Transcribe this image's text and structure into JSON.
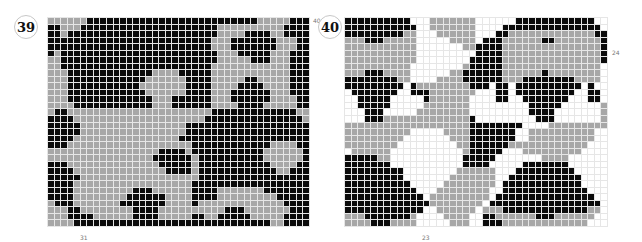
{
  "figures": [
    {
      "number": "39",
      "side_label": "40",
      "bottom_label": "31",
      "colors": {
        "B": "#0b0b0b",
        "G": "#a7a7a7",
        "W": "#ffffff"
      },
      "cols": 40,
      "rows": [
        "GGGGGGBBBBBBBBBBBBBBBBBBBBBBBBBBGGGGGBBB",
        "BBGGGBBBBBBBBBBBBBBBBBBBBBGGGGGGGGGGBBBB",
        "BBGBBBBBBBBBBBBBBBBBBBBBBBGGGGBBBBGGBBBB",
        "BBBBBBBBBBBBBBBBBBBBBBBBBGGGBBBBBBBGGGBB",
        "BBBBBBBBBBBBBBBBBBBBBBBBBGGGBBBBBBBGGGBB",
        "BGBBBBBBBBBBBBBBBBBBBBBBBBGGGBBBBBGGGBBB",
        "GGBBBBBBBBBBBBBBBBBBBBBBBBGGGGGBBBGGGBBB",
        "GGBBBBBBBBBBBBBBBBBBBBBBBGGGGGGGGGGGGBBB",
        "GGGBBBBBBBBBBBBBGGGGBBBBBGGGGGGGGGGGGBBB",
        "GGGBBBBBBBBBBBBGGGGGGBBBBGGGGGBBGGGGGBBB",
        "GGGBBBBBBBBBBBGGGGGGGBBBBGGGGBBBBGGGGBBB",
        "GGGBBBBBBBBBBBBGGGGGGBBBBGGGBBBBBBGGGBBB",
        "GGGBBBBBBBBBBBBBGGGBBBBBBGGGBBBBBBGGGGBB",
        "GGGGBBBBBBBBBBBBGGGBBBBBBGGGGBBBBGGGGGBB",
        "GBBGGGGGGGGGGGGGGGGGGGGGGBBBBBBBBBBBBBGG",
        "BBBBGGGGGGGGGGGGGGGGGGGGBBBBBBBBBBBBBBBG",
        "BBBBBGGGGGGGGGGGGGGGGBBBBBBBBBBBBBBBBBBB",
        "BBBBBGGGGGGGGGGGGGGGGBBBBBBBBBBBBBBBBBBB",
        "BBBBGGGGGGGGGGGGGGGGBBBBBBBBBBBBBBBBBBBB",
        "BBBGGGGGGGGGGGGGGGGGGGBBBBBBBBBBBBGGGGBB",
        "GGGGGGGGGGGGGGGGGBBBBGBBBBBBBBBBBGGGGGGB",
        "GGGGGGGGGGGGGGGGBBBBBBGBBBBBBBBBBGGGGGGB",
        "BBBGGGGGGGGGGGGGGBBBBBGBBBBBBBBBBBGGGGBB",
        "BBBBGGGGGGGGGGGGGGBBBBGBBBBBBBBBBBBGGBBB",
        "BBBBBGGGGGGGGGGGGGGGGGGBBBBBBBBBBBBBBBBB",
        "BBBBGGGGGGGGGGGGGGGGGGBBBBBBBBBBBBBBBBBB",
        "BBBBGGGGGGGGGBBBGGGGGGBBBBGGGGGGGBBBBBBB",
        "BBBBGGGGGGGGBBBBBBGGGGBBBBGGGGGGGGGBBBBB",
        "GBBBGGGGGGGBBBBBBBGGGGBGGGGGGGGGGGGGBBBB",
        "GGGBBGGGGGGGGBBBBGGGGGGGGGGBBBGGGGGGGBBB",
        "GGGBBBBGGGGGGBBBBGGGGGBBGGBBBBBGGGGGBBBB",
        "GGGGBBBBBBBBBBBBBBBBBBBBBBBBBBBBBBGGBBBB"
      ]
    },
    {
      "number": "40",
      "side_label": "24",
      "bottom_label": "23",
      "colors": {
        "B": "#0b0b0b",
        "G": "#a7a7a7",
        "W": "#ffffff"
      },
      "cols": 40,
      "rows": [
        "BBBBBBBBBBWWWGGGGGGGWWWWWWBBBBBBBBBBBBWW",
        "BBBBBBBBBBBWWGGGGGGGWWWWBBBBBBBBBBBBBBBW",
        "BBBBBBBBBGGWWWGGGGGGWWWBBGGGGGGGGGGGGGBB",
        "GGGBBBGGGGGWWWWWGGGGWBBBGGGGGGBBGGGGGGGB",
        "GGGGGGGGGGGWWWWWWWGGBBBBGGGGGGGGGGGGGGGB",
        "GGGGGGGGGGGWWWWWWWWWBBBBGGGGGGGGGGGGGGGB",
        "GGGGGGGGGGGWWWWWWWWBBBBBGGGGGGGGGGGGGGGB",
        "GGGGGGGGGGWWWWWWWWGBBBBBGGGGGGGGGGGGGGGW",
        "GGGBBBGGGGWWWWWWGGBBBBBBGGGGGGBGGGGGGGGW",
        "BBBBBBBBGGWWWWGGGGBBBBBBGGGBBBBBBBBGGGGW",
        "BBBBBBBBBWBGGGGGGGGBBBWBBWBBBBBBBBBBWBWW",
        "WBBBBBBBWWBBBGGGGGGGWWWBBWBBBBBBBBBWWBBW",
        "WWBBBBBWWWWWBGGGGGGWWWWBBWWBBBBBBBWWWBBW",
        "WWBBBBBWWWWWGGGGGGGWWWWWWWWWBBBBBWWWWWWG",
        "WWWBBBWWWWWGGGGGGGGWWWWWWWWWBBBBWWWWWWWG",
        "WWWBBBGGGGGGGGGGGGGBWWWWWWWWWBBBWWWWWWWG",
        "GGGGGGGGGGGGGGGGGGGBBBBBBBBWWWWGGGGGGGGG",
        "GGGGGGGGGGWWWWWGGGGBBBBBBBWWGGGGGGGGGGWW",
        "GGGGGGGGGWWWWWWWGGGBBBBBBBWWGGGGGGGGGGWW",
        "GGGGGGGGWWWWWWWWWGGBBBBBBGGGGGGGGGGGGWWW",
        "WGGGGGGWWWWWWWWWWWGBBBBBWWWGGGGGGGGGWWWW",
        "BBBBBGGWWWWWWWWWWWBBBBBWWWWWWWGGGGWWWWWW",
        "BBBBBBBWWWWWWWWWWWBBBBWWWWWBBBBBBBWWWWWW",
        "BBBBBBBBBWWWWWWWWGGGGGGWWWBBBBBBBBBWWWWW",
        "BBBBBBBBBWWWWWWWGGGGGGGWWBBBBBBBBBBBWWWW",
        "BBBBBBBBBBWWWWWGGGGGGGGWBBBBBBBBBBBBWWWW",
        "BBBBBBBBBBBWWWGGGGGGGGWWBBBBBBBBBBBBBWWW",
        "BBBBBBBBBBBBWGGGGGGGGGWBBBBBBBBBBBBBBBWW",
        "BBBBBBBBBBBBBGGGGGGGGWBBBBBBBBBBBBBBBBBW",
        "BBBBBBBBBBBBWWGGGGGGWGGGBBBBBBBBBBBBBGGW",
        "GGGBBBBBBBGWWWWGGGGWWBBGGGGGGBBBGGGGGGWW",
        "GGGGBBBGGGGWWWWWGGGWWBBBGGGGGGGGGGGGGWWW"
      ]
    }
  ]
}
